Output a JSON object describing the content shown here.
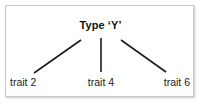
{
  "diagram": {
    "type": "tree",
    "root": {
      "label": "Type ‘Y’"
    },
    "leaves": [
      {
        "label": "trait 2"
      },
      {
        "label": "trait 4"
      },
      {
        "label": "trait 6"
      }
    ],
    "connectors": [
      {
        "name": "edge-root-to-trait-2",
        "x1": 81,
        "y1": 40,
        "x2": 34,
        "y2": 73
      },
      {
        "name": "edge-root-to-trait-4",
        "x1": 101,
        "y1": 38,
        "x2": 101,
        "y2": 72
      },
      {
        "name": "edge-root-to-trait-6",
        "x1": 121,
        "y1": 40,
        "x2": 166,
        "y2": 72
      }
    ],
    "colors": {
      "line": "#1c1c1c",
      "border": "#c9c9c9",
      "background": "#ffffff",
      "text": "#111111"
    }
  }
}
